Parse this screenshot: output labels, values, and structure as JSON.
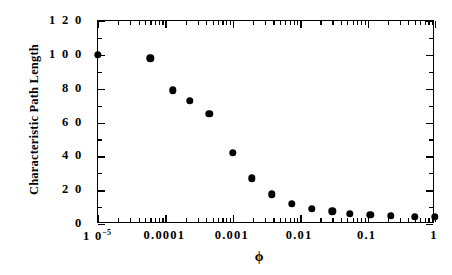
{
  "chart_data": {
    "type": "scatter",
    "title": "",
    "xlabel": "ϕ",
    "ylabel": "Characteristic Path Length",
    "xscale": "log",
    "yscale": "linear",
    "xlim": [
      1e-05,
      1
    ],
    "ylim": [
      0,
      120
    ],
    "grid": false,
    "legend": null,
    "marker": "filled-circle",
    "marker_color": "#000000",
    "x_tick_labels": [
      "1 0-5",
      "0.0001",
      "0.001",
      "0.01",
      "0.1",
      "1"
    ],
    "x_tick_values": [
      1e-05,
      0.0001,
      0.001,
      0.01,
      0.1,
      1
    ],
    "y_tick_labels": [
      "0",
      "2 0",
      "4 0",
      "6 0",
      "8 0",
      "1 0 0",
      "1 2 0"
    ],
    "y_tick_values": [
      0,
      20,
      40,
      60,
      80,
      100,
      120
    ],
    "series": [
      {
        "name": "Characteristic Path Length",
        "x": [
          1e-05,
          6e-05,
          0.00013,
          0.00023,
          0.00045,
          0.001,
          0.0019,
          0.0038,
          0.0075,
          0.015,
          0.03,
          0.055,
          0.11,
          0.22,
          0.5,
          1.0
        ],
        "y": [
          100.0,
          98.0,
          79.0,
          73.0,
          65.0,
          42.0,
          27.0,
          17.5,
          12.0,
          9.0,
          7.5,
          6.0,
          5.3,
          4.7,
          4.4,
          4.2
        ]
      }
    ]
  },
  "axes": {
    "y_title": "Characteristic Path Length",
    "x_title": "ϕ"
  }
}
